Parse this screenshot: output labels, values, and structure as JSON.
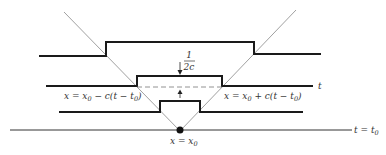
{
  "diagram": {
    "labels": {
      "fraction_num": "1",
      "fraction_den": "2c",
      "left_char_x": "x = x",
      "left_char_0": "0",
      "left_char_rest": " − c(t − t",
      "left_char_t0": "0",
      "left_char_close": ")",
      "right_char_x": "x = x",
      "right_char_0": "0",
      "right_char_rest": " + c(t − t",
      "right_char_t0": "0",
      "right_char_close": ")",
      "t_label": "t",
      "t0_label_t": "t = t",
      "t0_label_0": "0",
      "apex_x": "x = x",
      "apex_0": "0"
    },
    "colors": {
      "pulse": "#1a1a1a",
      "characteristic": "#888888",
      "dashed": "#777777"
    },
    "elements": {
      "characteristics": [
        "x = x0 − c(t − t0)",
        "x = x0 + c(t − t0)"
      ],
      "time_levels": [
        "t",
        "t = t0"
      ],
      "pulse_height_annotation": "1/2c",
      "apex_point": "x = x0"
    }
  }
}
